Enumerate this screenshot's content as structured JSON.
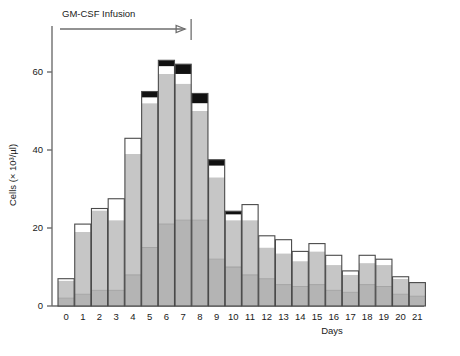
{
  "figure": {
    "annotation_label": "GM-CSF  Infusion",
    "annotation_start_day": 0,
    "annotation_end_day": 7.6,
    "arrow_icon": "right-arrow-icon"
  },
  "chart_data": {
    "type": "bar",
    "title": "",
    "subtitle": "",
    "xlabel": "Days",
    "ylabel": "Cells (× 10³/µl)",
    "stacked": true,
    "grid": false,
    "legend_position": "none",
    "xlim": [
      -0.5,
      21.5
    ],
    "ylim": [
      0,
      68
    ],
    "yticks": [
      0,
      20,
      40,
      60
    ],
    "ytick_labels": [
      "0",
      "20",
      "40",
      "60"
    ],
    "categories": [
      0,
      1,
      2,
      3,
      4,
      5,
      6,
      7,
      8,
      9,
      10,
      11,
      12,
      13,
      14,
      15,
      16,
      17,
      18,
      19,
      20,
      21
    ],
    "xtick_labels": [
      "0",
      "1",
      "2",
      "3",
      "4",
      "5",
      "6",
      "7",
      "8",
      "9",
      "10",
      "11",
      "12",
      "13",
      "14",
      "15",
      "16",
      "17",
      "18",
      "19",
      "20",
      "21"
    ],
    "series": [
      {
        "name": "lower-gray-segment",
        "color": "#b4b4b4",
        "values": [
          2.0,
          3.0,
          4.0,
          4.0,
          8.0,
          15.0,
          21.0,
          22.0,
          22.0,
          12.0,
          10.0,
          8.0,
          7.0,
          5.5,
          5.0,
          5.5,
          4.0,
          3.5,
          5.5,
          5.0,
          3.0,
          2.5
        ]
      },
      {
        "name": "upper-gray-segment",
        "color": "#c6c6c6",
        "values": [
          4.5,
          16.0,
          20.5,
          18.0,
          31.0,
          37.0,
          38.5,
          35.0,
          28.0,
          21.0,
          12.0,
          14.0,
          8.0,
          8.0,
          6.5,
          8.5,
          6.5,
          4.5,
          5.5,
          5.5,
          4.0,
          3.5
        ]
      },
      {
        "name": "white-segment",
        "color": "#ffffff",
        "values": [
          0.5,
          2.0,
          0.5,
          5.5,
          4.0,
          1.5,
          2.0,
          2.5,
          2.0,
          3.0,
          1.5,
          4.0,
          3.0,
          3.5,
          2.5,
          2.0,
          2.5,
          1.0,
          2.0,
          1.5,
          0.5,
          0.0
        ]
      },
      {
        "name": "black-segment",
        "color": "#111111",
        "values": [
          0.0,
          0.0,
          0.0,
          0.0,
          0.0,
          1.5,
          1.5,
          2.5,
          2.5,
          1.5,
          0.8,
          0.0,
          0.0,
          0.0,
          0.0,
          0.0,
          0.0,
          0.0,
          0.0,
          0.0,
          0.0,
          0.0
        ]
      }
    ],
    "totals": [
      7.0,
      21.0,
      25.0,
      27.5,
      43.0,
      55.0,
      63.0,
      62.0,
      54.5,
      37.5,
      24.3,
      26.0,
      18.0,
      17.0,
      14.0,
      16.0,
      13.0,
      9.0,
      13.0,
      12.0,
      7.5,
      6.0
    ]
  }
}
